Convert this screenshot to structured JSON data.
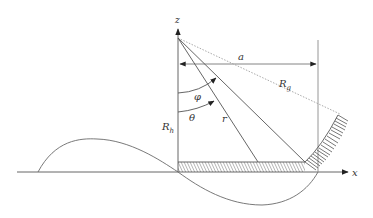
{
  "diagram": {
    "type": "geometry-schematic",
    "colors": {
      "line": "#555555",
      "light_line": "#9a9a9a",
      "dotted": "#a0a0a0",
      "hatch": "#555555",
      "background": "#ffffff"
    },
    "labels": {
      "z_axis": "z",
      "x_axis": "x",
      "a": "a",
      "Rg_main": "R",
      "Rg_sub": "g",
      "Rh_main": "R",
      "Rh_sub": "h",
      "phi": "φ",
      "theta": "θ",
      "r": "r"
    },
    "elements": [
      "z-axis with arrow",
      "x-axis with arrow",
      "horizontal dimension line a with double arrows",
      "vertical reference line at x = a",
      "dotted ray Rg from apex",
      "ray r from apex",
      "ray to floor corner",
      "angle arc phi",
      "angle arc theta",
      "hatched floor strip",
      "hatched curved wall",
      "sinusoidal wave curve"
    ]
  }
}
